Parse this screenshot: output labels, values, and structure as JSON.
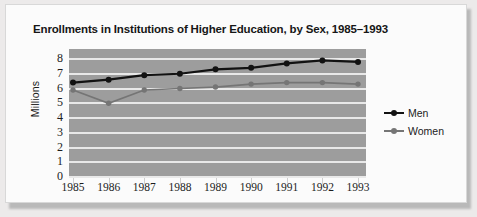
{
  "card": {
    "title": "Enrollments in Institutions of Higher Education, by Sex, 1985–1993"
  },
  "axes": {
    "ylabel": "Millions",
    "yticks": [
      "8",
      "7",
      "6",
      "5",
      "4",
      "3",
      "2",
      "1",
      "0"
    ],
    "xticks": [
      "1985",
      "1986",
      "1987",
      "1988",
      "1989",
      "1990",
      "1991",
      "1992",
      "1993"
    ]
  },
  "legend": {
    "items": [
      {
        "label": "Men",
        "color": "#121212"
      },
      {
        "label": "Women",
        "color": "#757575"
      }
    ]
  },
  "colors": {
    "plot_background": "#9d9d9d",
    "gridline": "#e9e9e9",
    "men": "#121212",
    "women": "#757575",
    "card": "#fbfbfb",
    "page": "#eceaea"
  },
  "chart_data": {
    "type": "line",
    "title": "Enrollments in Institutions of Higher Education, by Sex, 1985–1993",
    "xlabel": "",
    "ylabel": "Millions",
    "categories": [
      "1985",
      "1986",
      "1987",
      "1988",
      "1989",
      "1990",
      "1991",
      "1992",
      "1993"
    ],
    "series": [
      {
        "name": "Men",
        "color": "#121212",
        "values": [
          6.4,
          6.6,
          6.9,
          7.0,
          7.3,
          7.4,
          7.7,
          7.9,
          7.8
        ]
      },
      {
        "name": "Women",
        "color": "#757575",
        "values": [
          5.9,
          5.0,
          5.9,
          6.0,
          6.1,
          6.3,
          6.4,
          6.4,
          6.3
        ]
      }
    ],
    "ylim": [
      0,
      8
    ],
    "ytick_step": 1,
    "grid": true,
    "grid_orientation": "horizontal",
    "legend_position": "right"
  }
}
